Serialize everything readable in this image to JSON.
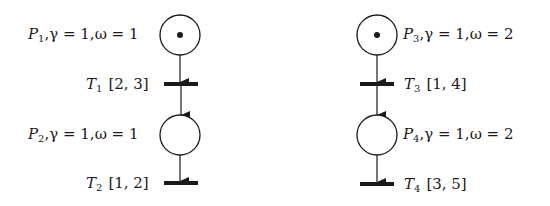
{
  "diagram": {
    "type": "petri-net",
    "stroke_color": "#1a1a1a",
    "background": "#ffffff",
    "nets": [
      {
        "name": "left-net",
        "places": [
          {
            "id": "P1",
            "name_letter": "P",
            "index": "1",
            "gamma_text": ",γ = 1,",
            "omega_text": "ω = 1",
            "tokens": 1,
            "cx": 180,
            "cy": 35,
            "r": 20,
            "label_side": "left",
            "label_x": 28,
            "label_y": 34
          },
          {
            "id": "P2",
            "name_letter": "P",
            "index": "2",
            "gamma_text": ",γ = 1,",
            "omega_text": "ω = 1",
            "tokens": 0,
            "cx": 180,
            "cy": 135,
            "r": 20,
            "label_side": "left",
            "label_x": 28,
            "label_y": 134
          }
        ],
        "transitions": [
          {
            "id": "T1",
            "name_letter": "T",
            "index": "1",
            "interval": "[2, 3]",
            "x1": 164,
            "x2": 198,
            "y": 84,
            "label_side": "left",
            "label_x": 86,
            "label_y": 84
          },
          {
            "id": "T2",
            "name_letter": "T",
            "index": "2",
            "interval": "[1, 2]",
            "x1": 164,
            "x2": 198,
            "y": 183,
            "label_side": "left",
            "label_x": 86,
            "label_y": 183
          }
        ]
      },
      {
        "name": "right-net",
        "places": [
          {
            "id": "P3",
            "name_letter": "P",
            "index": "3",
            "gamma_text": ",γ = 1,",
            "omega_text": "ω = 2",
            "tokens": 1,
            "cx": 377,
            "cy": 35,
            "r": 20,
            "label_side": "right",
            "label_x": 403,
            "label_y": 34
          },
          {
            "id": "P4",
            "name_letter": "P",
            "index": "4",
            "gamma_text": ",γ = 1,",
            "omega_text": "ω = 2",
            "tokens": 0,
            "cx": 377,
            "cy": 135,
            "r": 20,
            "label_side": "right",
            "label_x": 403,
            "label_y": 134
          }
        ],
        "transitions": [
          {
            "id": "T3",
            "name_letter": "T",
            "index": "3",
            "interval": "[1, 4]",
            "x1": 360,
            "x2": 394,
            "y": 84,
            "label_side": "right",
            "label_x": 404,
            "label_y": 84
          },
          {
            "id": "T4",
            "name_letter": "T",
            "index": "4",
            "interval": "[3, 5]",
            "x1": 360,
            "x2": 394,
            "y": 184,
            "label_side": "right",
            "label_x": 404,
            "label_y": 184
          }
        ]
      }
    ],
    "arcs": [
      {
        "from": "P1",
        "to": "T1"
      },
      {
        "from": "T1",
        "to": "P2"
      },
      {
        "from": "P2",
        "to": "T2"
      },
      {
        "from": "P3",
        "to": "T3"
      },
      {
        "from": "T3",
        "to": "P4"
      },
      {
        "from": "P4",
        "to": "T4"
      }
    ]
  }
}
